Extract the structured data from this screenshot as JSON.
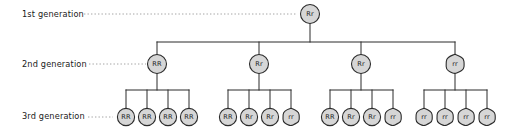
{
  "diagram": {
    "style": {
      "node_fill": "#d6d6d6",
      "node_stroke": "#2b2b2b",
      "connector_color": "#2b2b2b",
      "leader_color": "#9a9a9a",
      "background": "#ffffff",
      "text_color": "#1a1a1a"
    },
    "rows": [
      {
        "id": "gen1",
        "label": "1st generation",
        "label_x": 22,
        "label_y": 17,
        "leader": {
          "x1": 84,
          "x2": 297,
          "y": 14
        },
        "node_y": 14,
        "node_r": 9.5
      },
      {
        "id": "gen2",
        "label": "2nd generation",
        "label_x": 22,
        "label_y": 67,
        "leader": {
          "x1": 89,
          "x2": 146,
          "y": 64
        },
        "node_y": 64,
        "node_r": 9.5
      },
      {
        "id": "gen3",
        "label": "3rd generation",
        "label_x": 22,
        "label_y": 119,
        "leader": {
          "x1": 88,
          "x2": 113,
          "y": 117
        },
        "node_y": 117,
        "node_r": 8.6
      }
    ],
    "generation1": [
      {
        "genotype": "Rr",
        "x": 310,
        "shape": "circle"
      }
    ],
    "generation2": [
      {
        "genotype": "RR",
        "x": 157,
        "shape": "circle"
      },
      {
        "genotype": "Rr",
        "x": 259,
        "shape": "circle"
      },
      {
        "genotype": "Rr",
        "x": 361,
        "shape": "circle"
      },
      {
        "genotype": "rr",
        "x": 455,
        "shape": "blob"
      }
    ],
    "generation3": [
      {
        "genotype": "RR",
        "x": 126,
        "shape": "circle",
        "parent": 0
      },
      {
        "genotype": "RR",
        "x": 147,
        "shape": "circle",
        "parent": 0
      },
      {
        "genotype": "RR",
        "x": 168,
        "shape": "circle",
        "parent": 0
      },
      {
        "genotype": "RR",
        "x": 189,
        "shape": "circle",
        "parent": 0
      },
      {
        "genotype": "RR",
        "x": 228,
        "shape": "circle",
        "parent": 1
      },
      {
        "genotype": "Rr",
        "x": 249,
        "shape": "circle",
        "parent": 1
      },
      {
        "genotype": "Rr",
        "x": 270,
        "shape": "circle",
        "parent": 1
      },
      {
        "genotype": "rr",
        "x": 291,
        "shape": "blob",
        "parent": 1
      },
      {
        "genotype": "RR",
        "x": 330,
        "shape": "circle",
        "parent": 2
      },
      {
        "genotype": "Rr",
        "x": 351,
        "shape": "circle",
        "parent": 2
      },
      {
        "genotype": "Rr",
        "x": 372,
        "shape": "circle",
        "parent": 2
      },
      {
        "genotype": "rr",
        "x": 393,
        "shape": "blob",
        "parent": 2
      },
      {
        "genotype": "rr",
        "x": 424,
        "shape": "blob",
        "parent": 3
      },
      {
        "genotype": "rr",
        "x": 445,
        "shape": "blob",
        "parent": 3
      },
      {
        "genotype": "rr",
        "x": 466,
        "shape": "blob",
        "parent": 3
      },
      {
        "genotype": "rr",
        "x": 487,
        "shape": "blob",
        "parent": 3
      }
    ],
    "connectors": {
      "gen1_stem": {
        "x": 310,
        "y1": 23.5,
        "y2": 42
      },
      "gen2_bar": {
        "x1": 157,
        "x2": 455,
        "y": 42
      },
      "gen2_drops": [
        {
          "x": 157,
          "y1": 42,
          "y2": 54.5
        },
        {
          "x": 259,
          "y1": 42,
          "y2": 54.5
        },
        {
          "x": 361,
          "y1": 42,
          "y2": 54.5
        },
        {
          "x": 455,
          "y1": 42,
          "y2": 54.5
        }
      ],
      "gen3_groups": [
        {
          "stem_x": 157,
          "stem_y1": 73.5,
          "stem_y2": 90,
          "bar_x1": 126,
          "bar_x2": 189,
          "bar_y": 90,
          "drops": [
            126,
            147,
            168,
            189
          ],
          "drop_y2": 108.4
        },
        {
          "stem_x": 259,
          "stem_y1": 73.5,
          "stem_y2": 90,
          "bar_x1": 228,
          "bar_x2": 291,
          "bar_y": 90,
          "drops": [
            228,
            249,
            270,
            291
          ],
          "drop_y2": 108.4
        },
        {
          "stem_x": 361,
          "stem_y1": 73.5,
          "stem_y2": 90,
          "bar_x1": 330,
          "bar_x2": 393,
          "bar_y": 90,
          "drops": [
            330,
            351,
            372,
            393
          ],
          "drop_y2": 108.4
        },
        {
          "stem_x": 455,
          "stem_y1": 73.5,
          "stem_y2": 90,
          "bar_x1": 424,
          "bar_x2": 487,
          "bar_y": 90,
          "drops": [
            424,
            445,
            466,
            487
          ],
          "drop_y2": 108.4
        }
      ]
    }
  }
}
